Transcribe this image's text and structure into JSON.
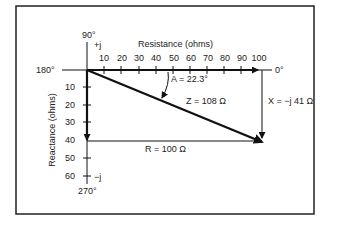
{
  "diagram": {
    "colors": {
      "line": "#111111",
      "frame": "#222222",
      "background": "#ffffff",
      "text": "#222222"
    },
    "axes": {
      "horizontal": {
        "label": "Resistance (ohms)",
        "ticks": [
          "10",
          "20",
          "30",
          "40",
          "50",
          "60",
          "70",
          "80",
          "90",
          "100"
        ],
        "left_angle": "180°",
        "right_angle": "0°"
      },
      "vertical": {
        "label": "Reactance (ohms)",
        "ticks": [
          "10",
          "20",
          "30",
          "40",
          "50",
          "60"
        ],
        "top_angle": "90°",
        "top_sign": "+j",
        "bottom_angle": "270°",
        "bottom_sign": "−j"
      }
    },
    "annotations": {
      "angle": "A = 22.3°",
      "impedance": "Z = 108 Ω",
      "reactance": "X = −j 41 Ω",
      "resistance": "R = 100 Ω"
    },
    "values": {
      "R_ohms": 100,
      "X_ohms": -41,
      "Z_ohms": 108,
      "angle_deg": 22.3
    }
  }
}
